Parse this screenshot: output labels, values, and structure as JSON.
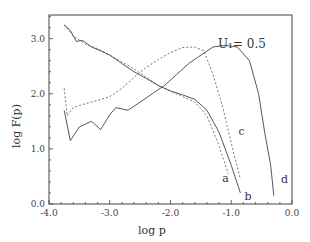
{
  "chart_data": {
    "type": "line",
    "title": "",
    "annotation": "U₁= 0.5",
    "xlabel": "log p",
    "ylabel": "log F(p)",
    "xlim": [
      -4.0,
      0.0
    ],
    "ylim": [
      0.0,
      3.4
    ],
    "x_ticks": [
      "-4.0",
      "-3.0",
      "-2.0",
      "-1.0",
      "0.0"
    ],
    "x_tick_values": [
      -4.0,
      -3.0,
      -2.0,
      -1.0,
      0.0
    ],
    "y_ticks": [
      "0.0",
      "1.0",
      "2.0",
      "3.0"
    ],
    "y_tick_values": [
      0.0,
      1.0,
      2.0,
      3.0
    ],
    "grid": false,
    "legend": "none; curves labeled inline a, b, c, d",
    "series": [
      {
        "name": "a",
        "style": "dotted",
        "x": [
          -3.75,
          -3.6,
          -3.4,
          -3.2,
          -3.0,
          -2.8,
          -2.6,
          -2.4,
          -2.2,
          -2.0,
          -1.8,
          -1.6,
          -1.4,
          -1.2,
          -1.05
        ],
        "y": [
          3.25,
          3.05,
          2.9,
          2.82,
          2.7,
          2.58,
          2.45,
          2.3,
          2.15,
          2.05,
          1.95,
          1.85,
          1.6,
          1.05,
          0.55
        ]
      },
      {
        "name": "b",
        "style": "solid",
        "x": [
          -3.75,
          -3.65,
          -3.55,
          -3.45,
          -3.3,
          -3.15,
          -3.0,
          -2.8,
          -2.6,
          -2.4,
          -2.2,
          -2.0,
          -1.8,
          -1.6,
          -1.4,
          -1.2,
          -1.0,
          -0.85
        ],
        "y": [
          3.25,
          3.15,
          2.95,
          2.97,
          2.85,
          2.78,
          2.7,
          2.55,
          2.4,
          2.28,
          2.15,
          2.05,
          1.98,
          1.9,
          1.7,
          1.3,
          0.7,
          0.2
        ]
      },
      {
        "name": "c",
        "style": "dotted",
        "x": [
          -3.75,
          -3.7,
          -3.6,
          -3.4,
          -3.2,
          -3.0,
          -2.8,
          -2.6,
          -2.4,
          -2.2,
          -2.0,
          -1.8,
          -1.6,
          -1.45,
          -1.3,
          -1.15,
          -1.0,
          -0.85
        ],
        "y": [
          2.1,
          1.6,
          1.75,
          1.82,
          1.88,
          1.95,
          2.1,
          2.3,
          2.48,
          2.62,
          2.75,
          2.84,
          2.85,
          2.78,
          2.35,
          1.8,
          1.1,
          0.45
        ]
      },
      {
        "name": "d",
        "style": "solid",
        "x": [
          -3.75,
          -3.65,
          -3.5,
          -3.3,
          -3.15,
          -3.0,
          -2.9,
          -2.7,
          -2.5,
          -2.3,
          -2.1,
          -1.9,
          -1.7,
          -1.5,
          -1.3,
          -1.1,
          -0.9,
          -0.7,
          -0.55,
          -0.45,
          -0.35,
          -0.3
        ],
        "y": [
          1.7,
          1.15,
          1.4,
          1.5,
          1.35,
          1.62,
          1.75,
          1.7,
          1.85,
          2.0,
          2.15,
          2.35,
          2.55,
          2.7,
          2.85,
          2.88,
          2.85,
          2.6,
          2.0,
          1.3,
          0.7,
          0.15
        ]
      }
    ],
    "curve_labels": [
      {
        "text": "a",
        "x": -1.15,
        "y": 0.4
      },
      {
        "text": "b",
        "x": -0.78,
        "y": 0.08
      },
      {
        "text": "c",
        "x": -0.88,
        "y": 1.25
      },
      {
        "text": "d",
        "x": -0.18,
        "y": 0.38
      }
    ]
  }
}
